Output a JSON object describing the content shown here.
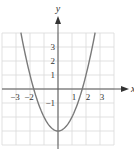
{
  "chart_data": {
    "type": "line",
    "title": "",
    "function": "y = x^2 - 3",
    "xlabel": "x",
    "ylabel": "y",
    "xlim": [
      -4,
      4
    ],
    "ylim": [
      -4,
      4
    ],
    "grid": true,
    "x_tick_labels": [
      {
        "value": -3,
        "label": "−3"
      },
      {
        "value": -2,
        "label": "−2"
      },
      {
        "value": 1,
        "label": "1"
      },
      {
        "value": 2,
        "label": "2"
      },
      {
        "value": 3,
        "label": "3"
      }
    ],
    "y_tick_labels": [
      {
        "value": 3,
        "label": "3"
      },
      {
        "value": 2,
        "label": "2"
      },
      {
        "value": 1,
        "label": "1"
      },
      {
        "value": -1,
        "label": "−1"
      }
    ],
    "series": [
      {
        "name": "parabola",
        "x": [
          -2.65,
          -2.5,
          -2,
          -1.5,
          -1,
          -0.5,
          0,
          0.5,
          1,
          1.5,
          2,
          2.5,
          2.65
        ],
        "y": [
          4.02,
          3.25,
          1,
          -0.75,
          -2,
          -2.75,
          -3,
          -2.75,
          -2,
          -0.75,
          1,
          3.25,
          4.02
        ]
      }
    ],
    "colors": {
      "curve": "#7a7a7a",
      "grid": "#d9d9d9",
      "axis": "#555555"
    }
  }
}
